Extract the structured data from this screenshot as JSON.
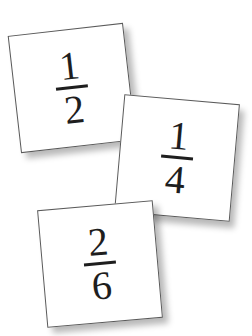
{
  "cards": [
    {
      "numerator": "1",
      "denominator": "2"
    },
    {
      "numerator": "1",
      "denominator": "4"
    },
    {
      "numerator": "2",
      "denominator": "6"
    }
  ],
  "colors": {
    "background": "#ffffff",
    "card": "#ffffff",
    "card_border": "#5a5a5a",
    "text": "#1e1e1e"
  }
}
